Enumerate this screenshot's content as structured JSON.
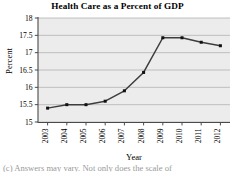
{
  "chart_data": {
    "type": "line",
    "title": "Health Care as a Percent of GDP",
    "xlabel": "Year",
    "ylabel": "Percent",
    "categories": [
      "2003",
      "2004",
      "2005",
      "2006",
      "2007",
      "2008",
      "2009",
      "2010",
      "2011",
      "2012"
    ],
    "values": [
      15.4,
      15.5,
      15.5,
      15.6,
      15.9,
      16.43,
      17.43,
      17.43,
      17.3,
      17.2
    ],
    "series": [
      {
        "name": "Health care percent of GDP",
        "values": [
          15.4,
          15.5,
          15.5,
          15.6,
          15.9,
          16.43,
          17.43,
          17.43,
          17.3,
          17.2
        ]
      }
    ],
    "ylim": [
      15,
      18
    ],
    "ytick_labels": [
      "15",
      "15.5",
      "16",
      "16.5",
      "17",
      "17.5",
      "18"
    ],
    "ytick_values": [
      15,
      15.5,
      16,
      16.5,
      17,
      17.5,
      18
    ],
    "xtick_labels": [
      "2003",
      "2004",
      "2005",
      "2006",
      "2007",
      "2008",
      "2009",
      "2010",
      "2011",
      "2012"
    ],
    "grid": "horizontal",
    "legend": "none",
    "marker": "filled-square",
    "line_color": "#3d3d3d",
    "marker_color": "#111111",
    "plot_background": "#ececed",
    "gridline_color": "#b9b9ba"
  },
  "caption": {
    "text": "(c)  Answers may vary. Not only does the scale of"
  }
}
